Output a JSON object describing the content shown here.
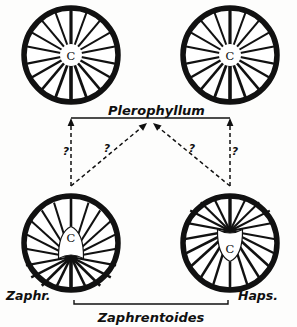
{
  "figure": {
    "title": "Plerophyllum",
    "background_color": "#fdfdfc",
    "ink_color": "#101010",
    "taxa": {
      "top_label": "Plerophyllum",
      "bottom_left_label": "Zaphr.",
      "bottom_right_label": "Haps.",
      "bottom_bracket_label": "Zaphrentoides"
    },
    "corallites": [
      {
        "id": "top-left",
        "position": "top-left",
        "center_label": "C",
        "septa_count": 18,
        "arrangement": "radial",
        "description": "Plerophyllum-type radial septa converging at centre"
      },
      {
        "id": "top-right",
        "position": "top-right",
        "center_label": "C",
        "septa_count": 18,
        "arrangement": "radial",
        "description": "Plerophyllum-type radial septa converging at centre"
      },
      {
        "id": "bottom-left",
        "position": "bottom-left",
        "center_label": "C",
        "septa_count": 18,
        "arrangement": "zaphrentoid",
        "description": "Zaphrentoides-type septa converging below centre with cardinal fossula above"
      },
      {
        "id": "bottom-right",
        "position": "bottom-right",
        "center_label": "C",
        "septa_count": 18,
        "arrangement": "hapsiphyllid",
        "description": "Hapsiphyllum-type septa converging above centre with cardinal fossula below"
      }
    ],
    "relationships": [
      {
        "id": "left-vertical",
        "from": "bottom-left",
        "to": "top-left",
        "style": "dashed-arrow",
        "uncertainty_label": "?"
      },
      {
        "id": "left-diagonal",
        "from": "bottom-left",
        "to": "plerophyllum-node",
        "style": "dashed-arrow",
        "uncertainty_label": "?"
      },
      {
        "id": "right-diagonal",
        "from": "bottom-right",
        "to": "plerophyllum-node",
        "style": "dashed-arrow",
        "uncertainty_label": "?"
      },
      {
        "id": "right-vertical",
        "from": "bottom-right",
        "to": "top-right",
        "style": "dashed-arrow",
        "uncertainty_label": "?"
      }
    ],
    "uncertainty_marks": [
      "?",
      "?",
      "?",
      "?"
    ]
  }
}
